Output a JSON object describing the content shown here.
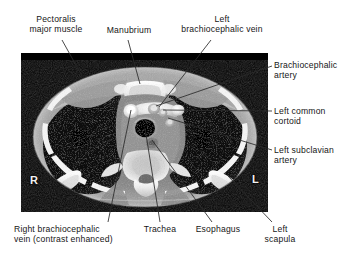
{
  "figure": {
    "kind": "annotated-axial-ct",
    "region": "upper thorax",
    "panel": {
      "x": 21,
      "y": 53,
      "width": 247,
      "height": 159,
      "background": "#000000"
    }
  },
  "orientation_markers": [
    {
      "id": "right",
      "text": "R",
      "x": 30,
      "y": 175
    },
    {
      "id": "left",
      "text": "L",
      "x": 252,
      "y": 174
    }
  ],
  "annotations": [
    {
      "id": "pectoralis-major-muscle",
      "text": "Pectoralis\nmajor muscle",
      "align": "center",
      "label": {
        "x": 14,
        "y": 14,
        "width": 84
      },
      "leader": {
        "x1": 62,
        "y1": 40,
        "x2": 82,
        "y2": 76
      }
    },
    {
      "id": "manubrium",
      "text": "Manubrium",
      "align": "center",
      "label": {
        "x": 98,
        "y": 25,
        "width": 62
      },
      "leader": {
        "x1": 128,
        "y1": 40,
        "x2": 140,
        "y2": 84
      }
    },
    {
      "id": "left-brachiocephalic-vein",
      "text": "Left\nbrachiocephalic vein",
      "align": "center",
      "label": {
        "x": 166,
        "y": 14,
        "width": 112
      },
      "leader": {
        "x1": 211,
        "y1": 40,
        "x2": 159,
        "y2": 107
      }
    },
    {
      "id": "brachiocephalic-artery",
      "text": "Brachiocephalic\nartery",
      "align": "left",
      "label": {
        "x": 274,
        "y": 60,
        "width": 84
      },
      "leader": {
        "x1": 272,
        "y1": 66,
        "x2": 156,
        "y2": 106
      }
    },
    {
      "id": "left-common-carotid",
      "text": "Left common\ncortoid",
      "align": "left",
      "label": {
        "x": 274,
        "y": 106,
        "width": 84
      },
      "leader": {
        "x1": 272,
        "y1": 111,
        "x2": 163,
        "y2": 110
      }
    },
    {
      "id": "left-subclavian-artery",
      "text": "Left subclavian\nartery",
      "align": "left",
      "label": {
        "x": 274,
        "y": 145,
        "width": 84
      },
      "leader": {
        "x1": 272,
        "y1": 150,
        "x2": 168,
        "y2": 118
      }
    },
    {
      "id": "right-brachiocephalic-vein",
      "text": "Right brachiocephalic\nvein (contrast enhanced)",
      "align": "left",
      "label": {
        "x": 14,
        "y": 224,
        "width": 140
      },
      "leader": {
        "x1": 108,
        "y1": 222,
        "x2": 131,
        "y2": 110
      }
    },
    {
      "id": "trachea",
      "text": "Trachea",
      "align": "center",
      "label": {
        "x": 136,
        "y": 224,
        "width": 48
      },
      "leader": {
        "x1": 160,
        "y1": 222,
        "x2": 145,
        "y2": 128
      }
    },
    {
      "id": "esophagus",
      "text": "Esophagus",
      "align": "center",
      "label": {
        "x": 188,
        "y": 224,
        "width": 60
      },
      "leader": {
        "x1": 212,
        "y1": 222,
        "x2": 152,
        "y2": 140
      }
    },
    {
      "id": "left-scapula",
      "text": "Left\nscapula",
      "align": "center",
      "label": {
        "x": 256,
        "y": 224,
        "width": 48
      },
      "leader": {
        "x1": 272,
        "y1": 222,
        "x2": 228,
        "y2": 176
      }
    }
  ]
}
